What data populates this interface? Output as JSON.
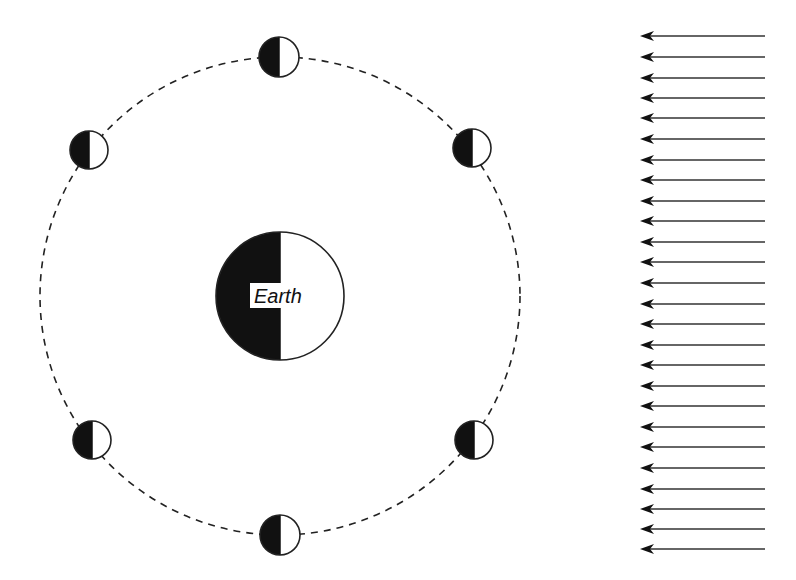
{
  "diagram": {
    "earth": {
      "label": "Earth",
      "cx": 280,
      "cy": 296,
      "r": 64,
      "dark_side": "left",
      "lit_side": "right"
    },
    "orbit": {
      "cx": 280,
      "cy": 296,
      "rx": 240,
      "ry": 239,
      "style": "dashed"
    },
    "moons": [
      {
        "position": "top",
        "cx": 279,
        "cy": 57,
        "r": 20
      },
      {
        "position": "upper-right",
        "cx": 472,
        "cy": 148,
        "r": 19
      },
      {
        "position": "lower-right",
        "cx": 474,
        "cy": 440,
        "r": 19
      },
      {
        "position": "bottom",
        "cx": 280,
        "cy": 535,
        "r": 20
      },
      {
        "position": "lower-left",
        "cx": 92,
        "cy": 440,
        "r": 19
      },
      {
        "position": "upper-left",
        "cx": 89,
        "cy": 150,
        "r": 19
      }
    ],
    "sunlight_arrows": {
      "direction": "left",
      "x_tail": 765,
      "x_tip": 640,
      "y_positions": [
        36,
        57,
        78,
        98,
        118,
        139,
        160,
        180,
        201,
        221,
        242,
        262,
        283,
        304,
        324,
        345,
        365,
        386,
        406,
        427,
        447,
        468,
        489,
        509,
        529,
        549
      ],
      "count": 26
    },
    "colors": {
      "dark": "#111111",
      "light": "#ffffff",
      "stroke": "#222222",
      "arrow": "#333333"
    }
  }
}
